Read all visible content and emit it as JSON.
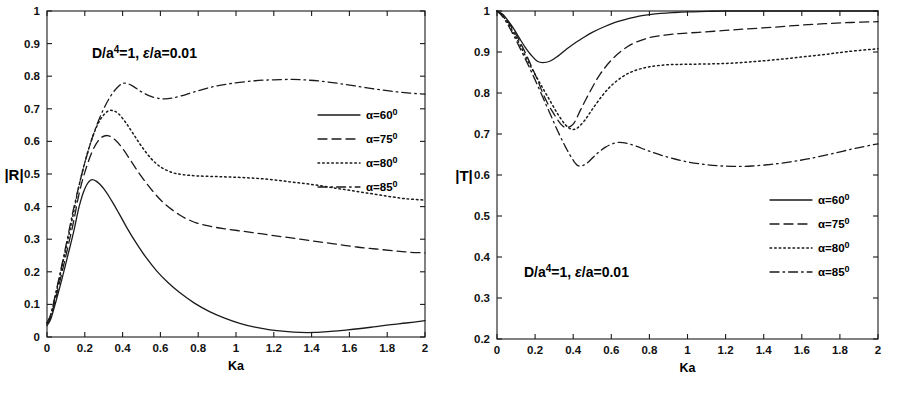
{
  "figure": {
    "panel_count": 2,
    "background": "#ffffff",
    "line_color": "#1a1a1a"
  },
  "legend_series": [
    {
      "key": "a60",
      "label": "α=60",
      "sup": "0",
      "dash": "none"
    },
    {
      "key": "a75",
      "label": "α=75",
      "sup": "0",
      "dash": "dashed"
    },
    {
      "key": "a80",
      "label": "α=80",
      "sup": "0",
      "dash": "dotted"
    },
    {
      "key": "a85",
      "label": "α=85",
      "sup": "0",
      "dash": "dashdot"
    }
  ],
  "annotation": {
    "prefix": "D/a",
    "exponent": "4",
    "middle": "=1, ",
    "epsilon": "ε",
    "suffix": "/a=0.01"
  },
  "chart_data": [
    {
      "id": "reflection",
      "type": "line",
      "title": "",
      "annotation": "D/a4=1, ε/a=0.01",
      "xlabel": "Ka",
      "ylabel": "|R|",
      "xlim": [
        0,
        2
      ],
      "ylim": [
        0,
        1
      ],
      "xticks": [
        0,
        0.2,
        0.4,
        0.6,
        0.8,
        1,
        1.2,
        1.4,
        1.6,
        1.8,
        2
      ],
      "xticklabels": [
        "0",
        "0.2",
        "0.4",
        "0.6",
        "0.8",
        "1",
        "1.2",
        "1.4",
        "1.6",
        "1.8",
        "2"
      ],
      "yticks": [
        0,
        0.1,
        0.2,
        0.3,
        0.4,
        0.5,
        0.6,
        0.7,
        0.8,
        0.9,
        1
      ],
      "yticklabels": [
        "0",
        "0.1",
        "0.2",
        "0.3",
        "0.4",
        "0.5",
        "0.6",
        "0.7",
        "0.8",
        "0.9",
        "1"
      ],
      "grid": false,
      "legend_position": "right-middle",
      "series": [
        {
          "name": "α=60°",
          "dash": "none",
          "x": [
            0.0,
            0.02,
            0.05,
            0.08,
            0.11,
            0.14,
            0.17,
            0.2,
            0.23,
            0.26,
            0.3,
            0.34,
            0.38,
            0.42,
            0.47,
            0.52,
            0.58,
            0.64,
            0.7,
            0.78,
            0.86,
            0.94,
            1.02,
            1.1,
            1.18,
            1.26,
            1.34,
            1.42,
            1.5,
            1.58,
            1.66,
            1.74,
            1.82,
            1.9,
            2.0
          ],
          "y": [
            0.035,
            0.055,
            0.115,
            0.18,
            0.25,
            0.32,
            0.4,
            0.455,
            0.481,
            0.478,
            0.455,
            0.42,
            0.38,
            0.338,
            0.29,
            0.247,
            0.203,
            0.167,
            0.137,
            0.104,
            0.078,
            0.058,
            0.042,
            0.03,
            0.022,
            0.017,
            0.014,
            0.014,
            0.017,
            0.021,
            0.026,
            0.032,
            0.038,
            0.043,
            0.05
          ]
        },
        {
          "name": "α=75°",
          "dash": "dashed",
          "x": [
            0.0,
            0.02,
            0.05,
            0.08,
            0.11,
            0.14,
            0.17,
            0.2,
            0.24,
            0.28,
            0.32,
            0.36,
            0.4,
            0.45,
            0.5,
            0.56,
            0.62,
            0.7,
            0.78,
            0.86,
            0.94,
            1.04,
            1.14,
            1.24,
            1.34,
            1.44,
            1.54,
            1.64,
            1.74,
            1.84,
            1.92,
            2.0
          ],
          "y": [
            0.04,
            0.062,
            0.128,
            0.2,
            0.275,
            0.352,
            0.44,
            0.505,
            0.57,
            0.608,
            0.618,
            0.605,
            0.578,
            0.535,
            0.492,
            0.447,
            0.41,
            0.375,
            0.352,
            0.34,
            0.332,
            0.324,
            0.316,
            0.308,
            0.3,
            0.292,
            0.284,
            0.276,
            0.27,
            0.264,
            0.26,
            0.258
          ]
        },
        {
          "name": "α=80°",
          "dash": "dotted",
          "x": [
            0.0,
            0.02,
            0.05,
            0.08,
            0.11,
            0.14,
            0.17,
            0.2,
            0.24,
            0.28,
            0.32,
            0.35,
            0.38,
            0.42,
            0.46,
            0.5,
            0.55,
            0.6,
            0.66,
            0.72,
            0.8,
            0.9,
            1.0,
            1.1,
            1.2,
            1.3,
            1.4,
            1.5,
            1.6,
            1.7,
            1.8,
            1.9,
            2.0
          ],
          "y": [
            0.042,
            0.068,
            0.14,
            0.218,
            0.298,
            0.38,
            0.465,
            0.535,
            0.612,
            0.665,
            0.692,
            0.694,
            0.684,
            0.655,
            0.62,
            0.585,
            0.548,
            0.522,
            0.505,
            0.498,
            0.494,
            0.492,
            0.49,
            0.487,
            0.482,
            0.475,
            0.468,
            0.459,
            0.45,
            0.441,
            0.432,
            0.424,
            0.42
          ]
        },
        {
          "name": "α=85°",
          "dash": "dashdot",
          "x": [
            0.0,
            0.02,
            0.05,
            0.08,
            0.11,
            0.14,
            0.18,
            0.22,
            0.26,
            0.3,
            0.34,
            0.38,
            0.41,
            0.45,
            0.5,
            0.55,
            0.6,
            0.64,
            0.7,
            0.78,
            0.88,
            0.98,
            1.1,
            1.2,
            1.3,
            1.38,
            1.46,
            1.54,
            1.62,
            1.72,
            1.82,
            1.92,
            2.0
          ],
          "y": [
            0.045,
            0.07,
            0.145,
            0.225,
            0.308,
            0.392,
            0.49,
            0.575,
            0.645,
            0.7,
            0.742,
            0.77,
            0.779,
            0.771,
            0.752,
            0.738,
            0.731,
            0.731,
            0.738,
            0.752,
            0.768,
            0.778,
            0.786,
            0.789,
            0.79,
            0.788,
            0.784,
            0.778,
            0.771,
            0.762,
            0.754,
            0.748,
            0.745
          ]
        }
      ]
    },
    {
      "id": "transmission",
      "type": "line",
      "title": "",
      "annotation": "D/a4=1, ε/a=0.01",
      "xlabel": "Ka",
      "ylabel": "|T|",
      "xlim": [
        0,
        2
      ],
      "ylim": [
        0.2,
        1
      ],
      "xticks": [
        0,
        0.2,
        0.4,
        0.6,
        0.8,
        1,
        1.2,
        1.4,
        1.6,
        1.8,
        2
      ],
      "xticklabels": [
        "0",
        "0.2",
        "0.4",
        "0.6",
        "0.8",
        "1",
        "1.2",
        "1.4",
        "1.6",
        "1.8",
        "2"
      ],
      "yticks": [
        0.2,
        0.3,
        0.4,
        0.5,
        0.6,
        0.7,
        0.8,
        0.9,
        1
      ],
      "yticklabels": [
        "0.2",
        "0.3",
        "0.4",
        "0.5",
        "0.6",
        "0.7",
        "0.8",
        "0.9",
        "1"
      ],
      "grid": false,
      "legend_position": "right-lower",
      "series": [
        {
          "name": "α=60°",
          "dash": "none",
          "x": [
            0.0,
            0.03,
            0.06,
            0.09,
            0.12,
            0.15,
            0.18,
            0.21,
            0.24,
            0.28,
            0.32,
            0.36,
            0.4,
            0.45,
            0.5,
            0.56,
            0.62,
            0.68,
            0.74,
            0.8,
            0.86,
            0.92,
            1.0,
            1.1,
            1.2,
            1.35,
            1.5,
            1.7,
            1.85,
            2.0
          ],
          "y": [
            1.0,
            0.992,
            0.975,
            0.955,
            0.932,
            0.91,
            0.892,
            0.878,
            0.874,
            0.878,
            0.89,
            0.905,
            0.919,
            0.934,
            0.948,
            0.961,
            0.972,
            0.98,
            0.987,
            0.991,
            0.994,
            0.996,
            0.998,
            0.999,
            1.0,
            1.0,
            1.0,
            1.0,
            1.0,
            1.0
          ]
        },
        {
          "name": "α=75°",
          "dash": "dashed",
          "x": [
            0.0,
            0.03,
            0.06,
            0.09,
            0.12,
            0.15,
            0.18,
            0.21,
            0.24,
            0.27,
            0.3,
            0.33,
            0.36,
            0.4,
            0.44,
            0.49,
            0.54,
            0.6,
            0.66,
            0.72,
            0.8,
            0.88,
            0.96,
            1.06,
            1.18,
            1.3,
            1.44,
            1.58,
            1.72,
            1.86,
            2.0
          ],
          "y": [
            1.0,
            0.99,
            0.972,
            0.95,
            0.925,
            0.897,
            0.866,
            0.835,
            0.8,
            0.771,
            0.748,
            0.727,
            0.716,
            0.724,
            0.76,
            0.805,
            0.845,
            0.88,
            0.905,
            0.922,
            0.935,
            0.941,
            0.945,
            0.948,
            0.952,
            0.956,
            0.96,
            0.965,
            0.969,
            0.972,
            0.974
          ]
        },
        {
          "name": "α=80°",
          "dash": "dotted",
          "x": [
            0.0,
            0.03,
            0.06,
            0.09,
            0.12,
            0.16,
            0.2,
            0.24,
            0.28,
            0.32,
            0.36,
            0.39,
            0.42,
            0.46,
            0.5,
            0.55,
            0.6,
            0.66,
            0.72,
            0.8,
            0.9,
            1.0,
            1.12,
            1.24,
            1.36,
            1.48,
            1.6,
            1.72,
            1.84,
            2.0
          ],
          "y": [
            1.0,
            0.988,
            0.968,
            0.944,
            0.918,
            0.88,
            0.845,
            0.812,
            0.78,
            0.748,
            0.722,
            0.712,
            0.714,
            0.733,
            0.76,
            0.792,
            0.818,
            0.84,
            0.854,
            0.864,
            0.869,
            0.87,
            0.871,
            0.873,
            0.877,
            0.882,
            0.888,
            0.894,
            0.901,
            0.908
          ]
        },
        {
          "name": "α=85°",
          "dash": "dashdot",
          "x": [
            0.0,
            0.03,
            0.06,
            0.09,
            0.12,
            0.16,
            0.2,
            0.24,
            0.28,
            0.32,
            0.36,
            0.4,
            0.43,
            0.47,
            0.52,
            0.57,
            0.62,
            0.66,
            0.72,
            0.8,
            0.9,
            1.0,
            1.1,
            1.18,
            1.26,
            1.34,
            1.44,
            1.54,
            1.64,
            1.76,
            1.88,
            2.0
          ],
          "y": [
            1.0,
            0.986,
            0.964,
            0.938,
            0.91,
            0.872,
            0.832,
            0.79,
            0.748,
            0.706,
            0.668,
            0.636,
            0.622,
            0.628,
            0.65,
            0.668,
            0.678,
            0.679,
            0.672,
            0.658,
            0.643,
            0.632,
            0.625,
            0.622,
            0.621,
            0.622,
            0.626,
            0.632,
            0.64,
            0.652,
            0.665,
            0.676
          ]
        }
      ]
    }
  ]
}
